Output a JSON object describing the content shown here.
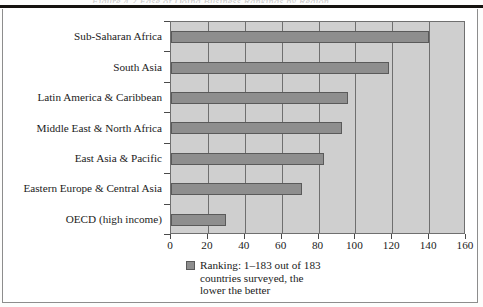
{
  "page": {
    "ghost_text_above_rule": "Figure 4.2  Ease of Doing Business Rankings by Region"
  },
  "chart_data": {
    "type": "bar",
    "orientation": "horizontal",
    "title": "",
    "xlabel": "",
    "ylabel": "",
    "xlim": [
      0,
      160
    ],
    "xticks": [
      0,
      20,
      40,
      60,
      80,
      100,
      120,
      140,
      160
    ],
    "xtick_labels": [
      "0",
      "20",
      "40",
      "60",
      "80",
      "100",
      "120",
      "140",
      "160"
    ],
    "grid": "vertical",
    "categories": [
      "Sub-Saharan Africa",
      "South Asia",
      "Latin America & Caribbean",
      "Middle East & North Africa",
      "East Asia & Pacific",
      "Eastern Europe & Central Asia",
      "OECD (high income)"
    ],
    "values": [
      140,
      118,
      96,
      93,
      83,
      71,
      30
    ],
    "series": [
      {
        "name": "Ranking: 1–183 out of 183 countries surveyed, the lower the better",
        "values": [
          140,
          118,
          96,
          93,
          83,
          71,
          30
        ],
        "color": "#8e8e8e",
        "edge_color": "#5a5a5a"
      }
    ],
    "legend": {
      "position": "bottom",
      "swatch_color": "#8e8e8e",
      "lines": [
        "Ranking: 1–183 out of 183",
        "countries surveyed, the",
        "lower the better"
      ]
    },
    "colors": {
      "plot_background": "#cfcfcf",
      "axis": "#6f6f6f",
      "text": "#1b1b1b",
      "page_rule": "#15130f"
    }
  }
}
